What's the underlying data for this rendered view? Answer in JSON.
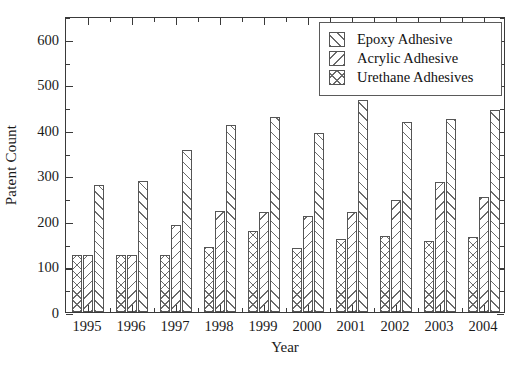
{
  "chart_data": {
    "type": "bar",
    "title": "",
    "xlabel": "Year",
    "ylabel": "Patent Count",
    "categories": [
      "1995",
      "1996",
      "1997",
      "1998",
      "1999",
      "2000",
      "2001",
      "2002",
      "2003",
      "2004"
    ],
    "series": [
      {
        "name": "Epoxy Adhesive",
        "hatch": "cross",
        "values": [
          125,
          125,
          125,
          143,
          178,
          141,
          161,
          166,
          157,
          165
        ]
      },
      {
        "name": "Acrylic Adhesive",
        "hatch": "backslash",
        "values": [
          125,
          125,
          192,
          221,
          219,
          210,
          219,
          246,
          285,
          253
        ]
      },
      {
        "name": "Urethane Adhesives",
        "hatch": "forwardslash",
        "values": [
          280,
          288,
          355,
          410,
          428,
          393,
          465,
          418,
          423,
          443
        ]
      }
    ],
    "ylim": [
      0,
      650
    ],
    "ytick_labels": [
      "0",
      "100",
      "200",
      "300",
      "400",
      "500",
      "600"
    ],
    "ytick_values": [
      0,
      100,
      200,
      300,
      400,
      500,
      600
    ],
    "yminor_step": 50,
    "grid": false,
    "legend_position": "top-right",
    "legend_entries": [
      "Epoxy Adhesive",
      "Acrylic Adhesive",
      "Urethane Adhesives"
    ],
    "bar_edge_color": "#555555",
    "bar_face_color": "#ffffff",
    "hatch_color": "#6b6b6b",
    "axis_color": "#3a3a3a"
  }
}
